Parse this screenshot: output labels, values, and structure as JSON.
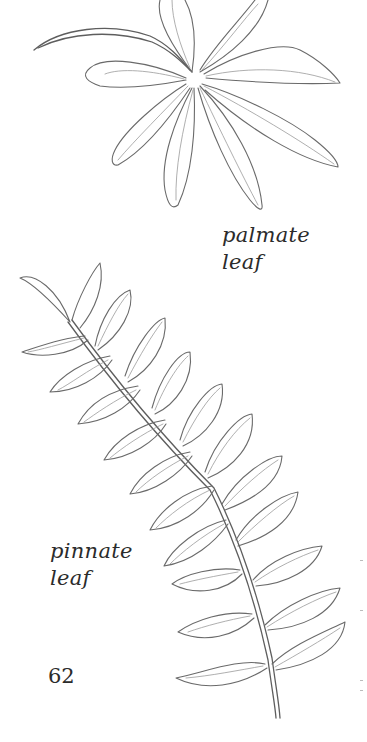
{
  "page": {
    "number": "62"
  },
  "figures": [
    {
      "id": "palmate",
      "label_lines": [
        "palmate",
        "leaf"
      ]
    },
    {
      "id": "pinnate",
      "label_lines": [
        "pinnate",
        "leaf"
      ]
    }
  ],
  "colors": {
    "ink": "#2b2b2b",
    "line": "#6a6a6a",
    "background": "#ffffff"
  }
}
